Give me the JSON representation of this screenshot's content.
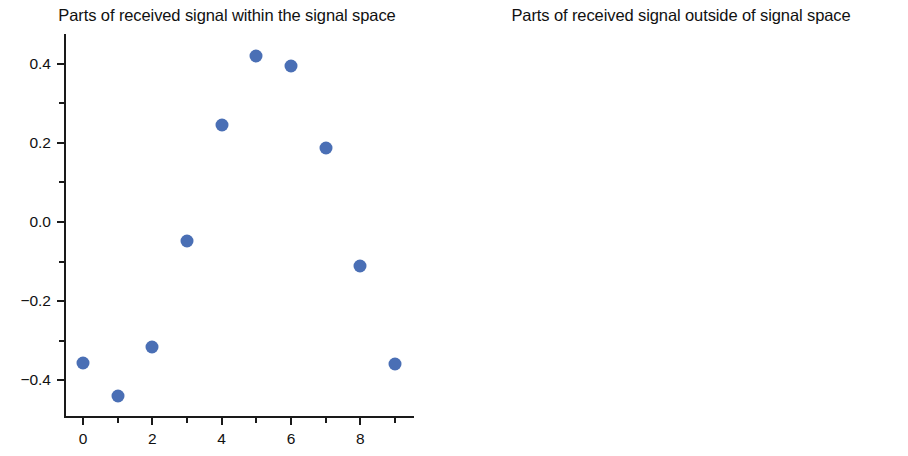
{
  "figure": {
    "background": "#ffffff",
    "marker_color": "#4a6fb5",
    "axis_color": "#1a1a1a"
  },
  "chart_data": [
    {
      "type": "scatter",
      "title": "Parts of received signal within the signal space",
      "xlabel": "",
      "ylabel": "",
      "x": [
        0,
        1,
        2,
        3,
        4,
        5,
        6,
        7,
        8,
        9
      ],
      "values": [
        -0.355,
        -0.44,
        -0.315,
        -0.048,
        0.244,
        0.42,
        0.395,
        0.186,
        -0.112,
        -0.358
      ],
      "xlim": [
        -0.55,
        9.55
      ],
      "ylim": [
        -0.49,
        0.475
      ],
      "xticks": [
        0,
        2,
        4,
        6,
        8
      ],
      "xtick_labels": [
        "0",
        "2",
        "4",
        "6",
        "8"
      ],
      "xminor_ticks": [
        1,
        3,
        5,
        7,
        9
      ],
      "yticks": [
        0.4,
        0.2,
        0.0,
        -0.2,
        -0.4
      ],
      "ytick_labels": [
        "0.4",
        "0.2",
        "0.0",
        "−0.2",
        "−0.4"
      ],
      "yminor_ticks": [
        0.3,
        0.1,
        -0.1,
        -0.3
      ],
      "grid": false,
      "legend": null,
      "marker_color": "#4a6fb5"
    },
    {
      "type": "scatter",
      "title": "Parts of received signal outside of signal space",
      "xlabel": "",
      "ylabel": "",
      "x": [
        0,
        1,
        2,
        3,
        4,
        5,
        6,
        7,
        8,
        9
      ],
      "values": [
        1.14,
        -1.01,
        -0.26,
        0.49,
        -0.36,
        0.56,
        0.42,
        -1.68,
        0.72,
        0.05
      ],
      "xlim": [
        -0.55,
        9.55
      ],
      "ylim": [
        -1.82,
        1.27
      ],
      "xticks": [
        0,
        2,
        4,
        6,
        8
      ],
      "xtick_labels": [
        "0",
        "2",
        "4",
        "6",
        "8"
      ],
      "xminor_ticks": [
        1,
        3,
        5,
        7,
        9
      ],
      "yticks": [
        1.0,
        0.5,
        0.0,
        -0.5,
        -1.0,
        -1.5
      ],
      "ytick_labels": [
        "1.0",
        "0.5",
        "0.0",
        "−0.5",
        "−1.0",
        "−1.5"
      ],
      "yminor_ticks": [
        0.75,
        0.25,
        -0.25,
        -0.75,
        -1.25,
        -1.75
      ],
      "grid": false,
      "legend": null,
      "marker_color": "#4a6fb5"
    }
  ]
}
